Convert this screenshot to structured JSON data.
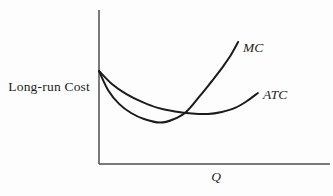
{
  "figure": {
    "background": "#fdfdfd"
  },
  "chart_data": {
    "type": "line",
    "title": "",
    "xlabel": "Q",
    "ylabel": "Long-run Cost",
    "xlim": [
      0,
      10
    ],
    "ylim": [
      0,
      10
    ],
    "grid": false,
    "ticks": "none",
    "legend_position": "curve-end-labels",
    "axis_color": "#3f3f3f",
    "series": [
      {
        "name": "MC",
        "shape": "steep U-shaped marginal cost curve, shares y-intercept with ATC, crosses ATC near its minimum then rises steeply",
        "color": "#1b1b1b",
        "points": [
          [
            0,
            6.04
          ],
          [
            0.39,
            4.81
          ],
          [
            0.87,
            3.9
          ],
          [
            1.39,
            3.31
          ],
          [
            1.95,
            2.92
          ],
          [
            2.64,
            2.69
          ],
          [
            3.2,
            2.89
          ],
          [
            3.77,
            3.38
          ],
          [
            4.37,
            4.42
          ],
          [
            4.89,
            5.39
          ],
          [
            5.32,
            6.23
          ],
          [
            5.71,
            7.08
          ],
          [
            6.02,
            7.92
          ]
        ]
      },
      {
        "name": "ATC",
        "shape": "gentle U-shaped average total cost curve, shares y-intercept with MC, shallow minimum then mild rise",
        "color": "#1b1b1b",
        "points": [
          [
            0,
            6.04
          ],
          [
            0.56,
            5.19
          ],
          [
            1.17,
            4.55
          ],
          [
            1.86,
            4.03
          ],
          [
            2.55,
            3.64
          ],
          [
            3.29,
            3.41
          ],
          [
            4.03,
            3.28
          ],
          [
            4.72,
            3.25
          ],
          [
            5.32,
            3.38
          ],
          [
            5.89,
            3.64
          ],
          [
            6.41,
            4.09
          ],
          [
            6.88,
            4.61
          ]
        ]
      }
    ],
    "annotations": {
      "shared_y_intercept": [
        0,
        6.04
      ],
      "curves_crossing_point": [
        3.7,
        3.35
      ]
    }
  }
}
